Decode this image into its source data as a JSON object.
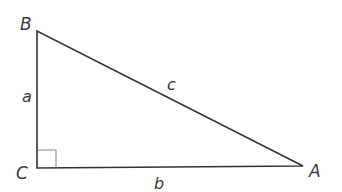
{
  "diagram": {
    "type": "right-triangle",
    "vertices": {
      "B": {
        "label": "B",
        "x": 37,
        "y": 31
      },
      "C": {
        "label": "C",
        "x": 37,
        "y": 168
      },
      "A": {
        "label": "A",
        "x": 303,
        "y": 166
      }
    },
    "sides": {
      "a": {
        "label": "a",
        "between": "B-C"
      },
      "b": {
        "label": "b",
        "between": "C-A"
      },
      "c": {
        "label": "c",
        "between": "B-A"
      }
    },
    "right_angle_at": "C",
    "colors": {
      "line": "#333333",
      "label": "#3a3a3a",
      "background": "#ffffff"
    }
  }
}
